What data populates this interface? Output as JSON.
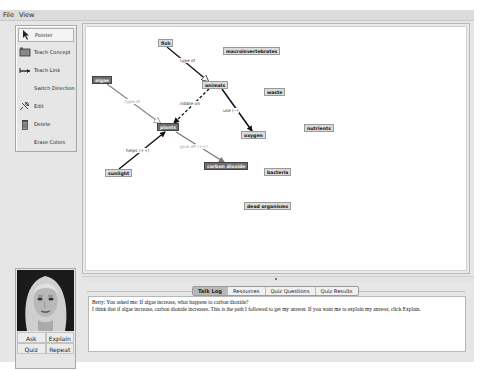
{
  "menu": {
    "items": [
      "File",
      "View"
    ]
  },
  "toolbar": {
    "tools": [
      {
        "label": "Pointer",
        "icon": "pointer-arrow-icon",
        "selected": true
      },
      {
        "label": "Teach Concept",
        "icon": "concept-box-icon"
      },
      {
        "label": "Teach Link",
        "icon": "link-arrow-icon"
      },
      {
        "label": "Switch Direction",
        "icon": null
      },
      {
        "label": "Edit",
        "icon": "edit-icon"
      },
      {
        "label": "Delete",
        "icon": "trash-icon"
      },
      {
        "label": "Erase Colors",
        "icon": null
      }
    ]
  },
  "concept_map": {
    "nodes": [
      {
        "id": "fish",
        "label": "fish",
        "style": "light"
      },
      {
        "id": "macroinvertebrates",
        "label": "macroinvertebrates",
        "style": "light"
      },
      {
        "id": "algae",
        "label": "algae",
        "style": "dark"
      },
      {
        "id": "animals",
        "label": "animals",
        "style": "light"
      },
      {
        "id": "waste",
        "label": "waste",
        "style": "light"
      },
      {
        "id": "plants",
        "label": "plants",
        "style": "dark"
      },
      {
        "id": "oxygen",
        "label": "oxygen",
        "style": "light"
      },
      {
        "id": "nutrients",
        "label": "nutrients",
        "style": "light"
      },
      {
        "id": "carbon_dioxide",
        "label": "carbon dioxide",
        "style": "dark"
      },
      {
        "id": "sunlight",
        "label": "sunlight",
        "style": "light"
      },
      {
        "id": "bacteria",
        "label": "bacteria",
        "style": "light"
      },
      {
        "id": "dead_organisms",
        "label": "dead organisms",
        "style": "light"
      }
    ],
    "links": [
      {
        "from": "fish",
        "to": "animals",
        "label": "type of"
      },
      {
        "from": "algae",
        "to": "plants",
        "label": "type of"
      },
      {
        "from": "animals",
        "to": "plants",
        "label": "nibble on"
      },
      {
        "from": "animals",
        "to": "oxygen",
        "label": "use (--)"
      },
      {
        "from": "sunlight",
        "to": "plants",
        "label": "helps (++)"
      },
      {
        "from": "plants",
        "to": "carbon_dioxide",
        "label": "give off (++)"
      }
    ]
  },
  "avatar": {
    "name": "Betty",
    "buttons": [
      "Ask",
      "Explain",
      "Quiz",
      "Repeat"
    ]
  },
  "bottom_panel": {
    "tabs": [
      {
        "label": "Talk Log",
        "active": true
      },
      {
        "label": "Resources"
      },
      {
        "label": "Quiz Questions"
      },
      {
        "label": "Quiz Results"
      }
    ],
    "talk_log": [
      "Betty: You asked me: If algae increase, what happens to carbon dioxide?",
      "I think that if algae increase, carbon dioxide increases. This is the path I followed to get my answer. If you want me to explain my answer, click Explain."
    ]
  }
}
